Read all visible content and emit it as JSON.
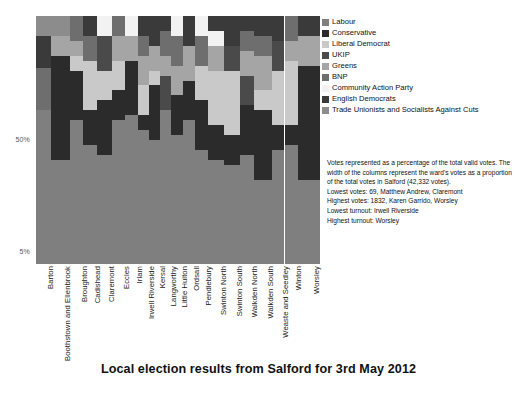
{
  "chart_data": {
    "type": "bar",
    "subtype": "stacked-percentage-marimekko",
    "title": "Local election results from Salford for 3rd May 2012",
    "xlabel": "",
    "ylabel": "",
    "ylim": [
      0,
      100
    ],
    "grid": false,
    "legend_position": "top-right",
    "y_ticks": [
      {
        "label": "50%",
        "value": 50
      },
      {
        "label": "5%",
        "value": 5
      }
    ],
    "series": [
      {
        "name": "Labour",
        "color": "#7f7f7f"
      },
      {
        "name": "Conservative",
        "color": "#2b2b2b"
      },
      {
        "name": "Liberal Democrat",
        "color": "#c9c9c9"
      },
      {
        "name": "UKIP",
        "color": "#4a4a4a"
      },
      {
        "name": "Greens",
        "color": "#a5a5a5"
      },
      {
        "name": "BNP",
        "color": "#6e6e6e"
      },
      {
        "name": "Community Action Party",
        "color": "#f2f2f2"
      },
      {
        "name": "English Democrats",
        "color": "#3a3a3a"
      },
      {
        "name": "Trade Unionists and Socialists Against Cuts",
        "color": "#8c8c8c"
      }
    ],
    "categories": [
      "Barton",
      "Boothstown and Ellenbrook",
      "Broughton",
      "Cadishead",
      "Claremont",
      "Eccles",
      "Irlam",
      "Irwell Riverside",
      "Kersal",
      "Langworthy",
      "Little Hulton",
      "Ordsall",
      "Pendlebury",
      "Swinton North",
      "Swinton South",
      "Walkden North",
      "Walkden South",
      "Weaste and Seedley",
      "Winton",
      "Worsley"
    ],
    "column_widths": [
      5.0,
      6.4,
      4.6,
      4.6,
      5.0,
      4.6,
      4.4,
      3.6,
      3.8,
      3.6,
      4.2,
      3.8,
      4.6,
      5.2,
      5.6,
      4.8,
      6.0,
      4.2,
      4.4,
      7.6
    ],
    "stacks": [
      {
        "ward": "Barton",
        "Labour": 62,
        "Conservative": 0,
        "Liberal Democrat": 0,
        "UKIP": 0,
        "Greens": 0,
        "BNP": 17,
        "Community Action Party": 0,
        "English Democrats": 13,
        "Trade Unionists and Socialists Against Cuts": 8
      },
      {
        "ward": "Boothstown and Ellenbrook",
        "Labour": 42,
        "Conservative": 42,
        "Liberal Democrat": 0,
        "UKIP": 0,
        "Greens": 8,
        "BNP": 0,
        "Community Action Party": 0,
        "English Democrats": 0,
        "Trade Unionists and Socialists Against Cuts": 8
      },
      {
        "ward": "Broughton",
        "Labour": 58,
        "Conservative": 20,
        "Liberal Democrat": 6,
        "UKIP": 0,
        "Greens": 6,
        "BNP": 10,
        "Community Action Party": 0,
        "English Democrats": 0,
        "Trade Unionists and Socialists Against Cuts": 0
      },
      {
        "ward": "Cadishead",
        "Labour": 48,
        "Conservative": 14,
        "Liberal Democrat": 20,
        "UKIP": 0,
        "Greens": 0,
        "BNP": 10,
        "Community Action Party": 0,
        "English Democrats": 8,
        "Trade Unionists and Socialists Against Cuts": 0
      },
      {
        "ward": "Claremont",
        "Labour": 44,
        "Conservative": 22,
        "Liberal Democrat": 12,
        "UKIP": 14,
        "Greens": 0,
        "BNP": 0,
        "Community Action Party": 8,
        "English Democrats": 0,
        "Trade Unionists and Socialists Against Cuts": 0
      },
      {
        "ward": "Eccles",
        "Labour": 58,
        "Conservative": 12,
        "Liberal Democrat": 12,
        "UKIP": 0,
        "Greens": 10,
        "BNP": 8,
        "Community Action Party": 0,
        "English Democrats": 0,
        "Trade Unionists and Socialists Against Cuts": 0
      },
      {
        "ward": "Irlam",
        "Labour": 60,
        "Conservative": 22,
        "Liberal Democrat": 0,
        "UKIP": 0,
        "Greens": 10,
        "BNP": 0,
        "Community Action Party": 8,
        "English Democrats": 0,
        "Trade Unionists and Socialists Against Cuts": 0
      },
      {
        "ward": "Irwell Riverside",
        "Labour": 54,
        "Conservative": 6,
        "Liberal Democrat": 12,
        "UKIP": 0,
        "Greens": 12,
        "BNP": 8,
        "Community Action Party": 0,
        "English Democrats": 8,
        "Trade Unionists and Socialists Against Cuts": 0
      },
      {
        "ward": "Kersal",
        "Labour": 50,
        "Conservative": 22,
        "Liberal Democrat": 6,
        "UKIP": 0,
        "Greens": 10,
        "BNP": 0,
        "Community Action Party": 0,
        "English Democrats": 12,
        "Trade Unionists and Socialists Against Cuts": 0
      },
      {
        "ward": "Langworthy",
        "Labour": 62,
        "Conservative": 0,
        "Liberal Democrat": 0,
        "UKIP": 14,
        "Greens": 8,
        "BNP": 10,
        "Community Action Party": 0,
        "English Democrats": 6,
        "Trade Unionists and Socialists Against Cuts": 0
      },
      {
        "ward": "Little Hulton",
        "Labour": 52,
        "Conservative": 16,
        "Liberal Democrat": 0,
        "UKIP": 0,
        "Greens": 12,
        "BNP": 12,
        "Community Action Party": 8,
        "English Democrats": 0,
        "Trade Unionists and Socialists Against Cuts": 0
      },
      {
        "ward": "Ordsall",
        "Labour": 58,
        "Conservative": 16,
        "Liberal Democrat": 0,
        "UKIP": 0,
        "Greens": 14,
        "BNP": 0,
        "Community Action Party": 0,
        "English Democrats": 12,
        "Trade Unionists and Socialists Against Cuts": 0
      },
      {
        "ward": "Pendlebury",
        "Labour": 46,
        "Conservative": 20,
        "Liberal Democrat": 14,
        "UKIP": 0,
        "Greens": 0,
        "BNP": 12,
        "Community Action Party": 8,
        "English Democrats": 0,
        "Trade Unionists and Socialists Against Cuts": 0
      },
      {
        "ward": "Swinton North",
        "Labour": 42,
        "Conservative": 14,
        "Liberal Democrat": 22,
        "UKIP": 0,
        "Greens": 10,
        "BNP": 0,
        "Community Action Party": 6,
        "English Democrats": 6,
        "Trade Unionists and Socialists Against Cuts": 0
      },
      {
        "ward": "Swinton South",
        "Labour": 40,
        "Conservative": 12,
        "Liberal Democrat": 26,
        "UKIP": 10,
        "Greens": 0,
        "BNP": 0,
        "Community Action Party": 0,
        "English Democrats": 12,
        "Trade Unionists and Socialists Against Cuts": 0
      },
      {
        "ward": "Walkden North",
        "Labour": 44,
        "Conservative": 20,
        "Liberal Democrat": 0,
        "UKIP": 12,
        "Greens": 10,
        "BNP": 8,
        "Community Action Party": 0,
        "English Democrats": 6,
        "Trade Unionists and Socialists Against Cuts": 0
      },
      {
        "ward": "Walkden South",
        "Labour": 34,
        "Conservative": 28,
        "Liberal Democrat": 8,
        "UKIP": 0,
        "Greens": 14,
        "BNP": 8,
        "Community Action Party": 0,
        "English Democrats": 8,
        "Trade Unionists and Socialists Against Cuts": 0
      },
      {
        "ward": "Weaste and Seedley",
        "Labour": 46,
        "Conservative": 10,
        "Liberal Democrat": 22,
        "UKIP": 12,
        "Greens": 0,
        "BNP": 0,
        "Community Action Party": 0,
        "English Democrats": 10,
        "Trade Unionists and Socialists Against Cuts": 0
      },
      {
        "ward": "Winton",
        "Labour": 48,
        "Conservative": 8,
        "Liberal Democrat": 26,
        "UKIP": 0,
        "Greens": 8,
        "BNP": 10,
        "Community Action Party": 0,
        "English Democrats": 0,
        "Trade Unionists and Socialists Against Cuts": 0
      },
      {
        "ward": "Worsley",
        "Labour": 34,
        "Conservative": 46,
        "Liberal Democrat": 0,
        "UKIP": 0,
        "Greens": 12,
        "BNP": 0,
        "Community Action Party": 0,
        "English Democrats": 8,
        "Trade Unionists and Socialists Against Cuts": 0
      }
    ],
    "notes": {
      "paragraph": "Votes represented as a percentage of the total valid votes. The width of the columns represent the ward's votes as a proportion of the total votes in Salford (42,332 votes).",
      "lines": [
        "Lowest votes: 69, Matthew Andrew, Claremont",
        "Highest votes: 1832, Karen Garrido, Worsley",
        "Lowest turnout: Irwell Riverside",
        "Highest turnout: Worsley"
      ]
    }
  }
}
